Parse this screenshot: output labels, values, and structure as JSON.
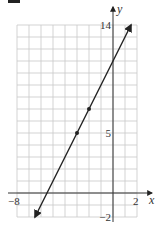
{
  "chart_data": {
    "type": "line",
    "title": "",
    "xlabel": "x",
    "ylabel": "y",
    "xlim": [
      -8,
      2
    ],
    "ylim": [
      -2,
      14
    ],
    "grid": true,
    "grid_step": 1,
    "x_tick_labels": [
      {
        "value": -8,
        "label": "−8"
      },
      {
        "value": 2,
        "label": "2"
      }
    ],
    "y_tick_labels": [
      {
        "value": 14,
        "label": "14"
      },
      {
        "value": 5,
        "label": "5"
      },
      {
        "value": -2,
        "label": "−2"
      }
    ],
    "series": [
      {
        "name": "line",
        "equation": "y = 2x + 11",
        "slope": 2,
        "intercept": 11,
        "x": [
          -6.5,
          1.5
        ],
        "y": [
          -2,
          14
        ],
        "arrows_both_ends": true,
        "marked_points": [
          {
            "x": -3,
            "y": 5
          },
          {
            "x": -2,
            "y": 7
          }
        ]
      }
    ]
  },
  "labels": {
    "x_axis": "x",
    "y_axis": "y",
    "x_min": "−8",
    "x_max": "2",
    "y_max": "14",
    "y_mid": "5",
    "y_min": "−2"
  },
  "colors": {
    "grid": "#c8c8c8",
    "axis": "#333333",
    "line": "#222222",
    "text": "#333333"
  },
  "layout": {
    "origin_px": [
      113,
      193
    ],
    "unit_px": 12
  }
}
